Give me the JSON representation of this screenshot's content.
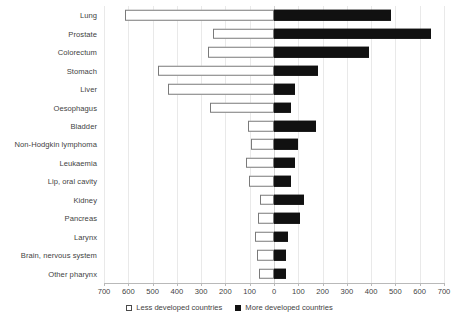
{
  "chart_data": {
    "type": "bar",
    "orientation": "horizontal",
    "subtype": "diverging-population-pyramid",
    "title": "",
    "subtitle": "",
    "xlabel": "",
    "ylabel": "",
    "grid": true,
    "legend_position": "bottom",
    "axis_ticks_left": [
      "700",
      "600",
      "500",
      "400",
      "300",
      "200",
      "100"
    ],
    "axis_tick_center": "0",
    "axis_ticks_right": [
      "100",
      "200",
      "300",
      "400",
      "500",
      "600",
      "700"
    ],
    "axis_tick_values": [
      700,
      600,
      500,
      400,
      300,
      200,
      100,
      0,
      100,
      200,
      300,
      400,
      500,
      600,
      700
    ],
    "xlim": [
      -700,
      700
    ],
    "tick_step": 100,
    "categories": [
      "Lung",
      "Prostate",
      "Colorectum",
      "Stomach",
      "Liver",
      "Oesophagus",
      "Bladder",
      "Non-Hodgkin lymphoma",
      "Leukaemia",
      "Lip, oral cavity",
      "Kidney",
      "Pancreas",
      "Larynx",
      "Brain, nervous system",
      "Other pharynx"
    ],
    "series": [
      {
        "name": "Less developed countries",
        "side": "left",
        "color": "#ffffff",
        "border": "#7a7a7a",
        "values": [
          613,
          251,
          272,
          477,
          436,
          263,
          107,
          95,
          115,
          103,
          58,
          66,
          78,
          70,
          62
        ]
      },
      {
        "name": "More developed countries",
        "side": "right",
        "color": "#111111",
        "border": "#111111",
        "values": [
          480,
          646,
          391,
          181,
          86,
          70,
          173,
          99,
          86,
          70,
          123,
          107,
          58,
          49,
          49
        ]
      }
    ],
    "legend": [
      {
        "label": "Less developed countries",
        "marker": "open-square"
      },
      {
        "label": "More developed countries",
        "marker": "filled-square"
      }
    ],
    "colors": {
      "less_developed": "#ffffff",
      "more_developed": "#111111",
      "gridline": "#e9e9e9",
      "axis": "#b9b9b9",
      "text": "#3f3f3f"
    }
  }
}
